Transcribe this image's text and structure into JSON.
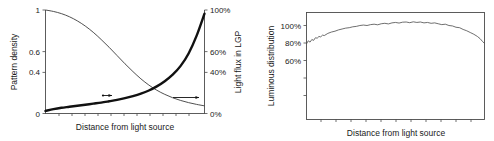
{
  "figure": {
    "background_color": "#ffffff",
    "panel_count": 2
  },
  "chart_data": [
    {
      "type": "line",
      "panel": "left",
      "title": "",
      "xlabel": "Distance from light source",
      "ylabel": "Pattern density",
      "ylabel_right": "Light flux in LGP",
      "xlim": [
        0,
        1
      ],
      "ylim": [
        0,
        1
      ],
      "ylim_right": [
        0,
        100
      ],
      "grid": false,
      "legend": "none",
      "x_tick_labels": [],
      "y_tick_labels": [
        "0",
        "0.4",
        "0.6",
        "1"
      ],
      "y_tick_values": [
        0,
        0.4,
        0.6,
        1
      ],
      "y_tick_labels_right": [
        "0%",
        "40%",
        "60%",
        "100%"
      ],
      "y_tick_values_right": [
        0,
        40,
        60,
        100
      ],
      "x_minor_tick_count": 11,
      "series": [
        {
          "name": "Pattern density",
          "axis": "left",
          "style": "thick",
          "color": "#111111",
          "x": [
            0.0,
            0.05,
            0.1,
            0.15,
            0.2,
            0.25,
            0.3,
            0.35,
            0.4,
            0.45,
            0.5,
            0.55,
            0.6,
            0.65,
            0.7,
            0.75,
            0.8,
            0.85,
            0.9,
            0.95,
            1.0
          ],
          "values": [
            0.025,
            0.042,
            0.055,
            0.065,
            0.075,
            0.085,
            0.095,
            0.105,
            0.118,
            0.132,
            0.148,
            0.168,
            0.192,
            0.222,
            0.262,
            0.312,
            0.375,
            0.46,
            0.58,
            0.75,
            0.965
          ]
        },
        {
          "name": "Light flux in LGP",
          "axis": "right",
          "style": "thin",
          "color": "#3c3c3c",
          "x": [
            0.0,
            0.05,
            0.1,
            0.15,
            0.2,
            0.25,
            0.3,
            0.35,
            0.4,
            0.45,
            0.5,
            0.55,
            0.6,
            0.65,
            0.7,
            0.75,
            0.8,
            0.85,
            0.9,
            0.95,
            1.0
          ],
          "values": [
            100.0,
            98.6,
            96.5,
            93.5,
            89.5,
            84.5,
            78.5,
            71.5,
            64.0,
            56.0,
            48.0,
            40.5,
            33.5,
            27.5,
            22.5,
            18.5,
            15.2,
            12.6,
            10.5,
            8.8,
            7.4
          ]
        }
      ],
      "annotations": [
        {
          "name": "pattern-density-arrow",
          "kind": "arrow",
          "direction": "right",
          "x_start": 0.36,
          "x_end": 0.42,
          "y_left_axis": 0.175
        },
        {
          "name": "light-flux-arrow",
          "kind": "arrow",
          "direction": "right",
          "x_start": 0.8,
          "x_end": 0.94,
          "y_left_axis": 0.17
        }
      ]
    },
    {
      "type": "line",
      "panel": "right",
      "title": "",
      "xlabel": "Distance from light source",
      "ylabel": "Luminous distribution",
      "xlim": [
        0,
        1
      ],
      "ylim": [
        0,
        115
      ],
      "grid": false,
      "legend": "none",
      "frame": "box",
      "x_tick_labels": [],
      "y_tick_labels": [
        "60%",
        "80%",
        "100%"
      ],
      "y_tick_values": [
        60,
        80,
        100
      ],
      "x_minor_tick_count": 11,
      "series": [
        {
          "name": "Luminous distribution",
          "style": "jagged",
          "color": "#4a4a4a",
          "x": [
            0.0,
            0.01,
            0.02,
            0.03,
            0.04,
            0.05,
            0.06,
            0.07,
            0.08,
            0.09,
            0.1,
            0.12,
            0.14,
            0.16,
            0.18,
            0.2,
            0.22,
            0.24,
            0.26,
            0.28,
            0.3,
            0.32,
            0.34,
            0.36,
            0.38,
            0.4,
            0.42,
            0.44,
            0.46,
            0.48,
            0.5,
            0.52,
            0.54,
            0.56,
            0.58,
            0.6,
            0.62,
            0.64,
            0.66,
            0.68,
            0.7,
            0.72,
            0.74,
            0.76,
            0.78,
            0.8,
            0.82,
            0.84,
            0.86,
            0.88,
            0.9,
            0.92,
            0.94,
            0.96,
            0.975,
            0.99,
            1.0
          ],
          "values": [
            79.0,
            82.5,
            81.0,
            84.0,
            83.0,
            86.0,
            85.5,
            87.5,
            87.0,
            89.0,
            88.5,
            91.0,
            92.5,
            93.5,
            95.0,
            96.0,
            97.0,
            97.5,
            98.5,
            99.0,
            100.0,
            100.5,
            100.0,
            101.0,
            101.5,
            100.8,
            102.0,
            102.5,
            101.8,
            103.0,
            103.5,
            102.8,
            103.8,
            104.0,
            103.2,
            104.2,
            103.5,
            104.0,
            103.0,
            103.5,
            102.5,
            103.0,
            102.0,
            101.0,
            101.5,
            100.0,
            99.5,
            98.0,
            97.5,
            95.5,
            94.0,
            92.0,
            90.0,
            87.5,
            85.0,
            81.5,
            79.5
          ]
        }
      ],
      "annotations": []
    }
  ]
}
